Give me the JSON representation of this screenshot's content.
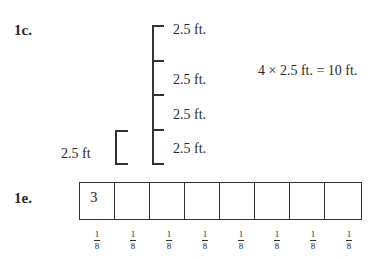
{
  "problem_1c": {
    "label": "1c.",
    "segments": [
      "2.5 ft.",
      "2.5  ft.",
      "2.5 ft.",
      "2.5 ft."
    ],
    "unit_label": "2.5 ft",
    "equation": "4 × 2.5 ft. = 10 ft."
  },
  "problem_1e": {
    "label": "1e.",
    "cells": [
      "3",
      "",
      "",
      "",
      "",
      "",
      "",
      ""
    ],
    "fractions": [
      {
        "num": "1",
        "den": "8"
      },
      {
        "num": "1",
        "den": "8"
      },
      {
        "num": "1",
        "den": "8"
      },
      {
        "num": "1",
        "den": "8"
      },
      {
        "num": "1",
        "den": "8"
      },
      {
        "num": "1",
        "den": "8"
      },
      {
        "num": "1",
        "den": "8"
      },
      {
        "num": "1",
        "den": "8"
      }
    ]
  }
}
